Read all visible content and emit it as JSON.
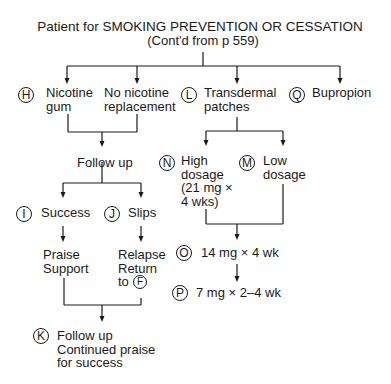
{
  "header": {
    "title": "Patient for SMOKING PREVENTION OR CESSATION",
    "subtitle": "(Cont'd from p 559)"
  },
  "nodes": {
    "H": {
      "marker": "H",
      "label": "Nicotine\ngum"
    },
    "no_nrt": {
      "label": "No nicotine\nreplacement"
    },
    "L": {
      "marker": "L",
      "label": "Transdermal\npatches"
    },
    "Q": {
      "marker": "Q",
      "label": "Bupropion"
    },
    "follow_up": {
      "label": "Follow up"
    },
    "I": {
      "marker": "I",
      "label": "Success"
    },
    "J": {
      "marker": "J",
      "label": "Slips"
    },
    "praise": {
      "label": "Praise\nSupport"
    },
    "relapse": {
      "label": "Relapse\nReturn\nto",
      "marker": "F"
    },
    "K": {
      "marker": "K",
      "label": "Follow up\nContinued praise\nfor success"
    },
    "N": {
      "marker": "N",
      "label": "High\ndosage\n(21 mg ×\n4 wks)"
    },
    "M": {
      "marker": "M",
      "label": "Low\ndosage"
    },
    "O": {
      "marker": "O",
      "label": "14 mg × 4 wk"
    },
    "P": {
      "marker": "P",
      "label": "7 mg × 2–4 wk"
    }
  }
}
